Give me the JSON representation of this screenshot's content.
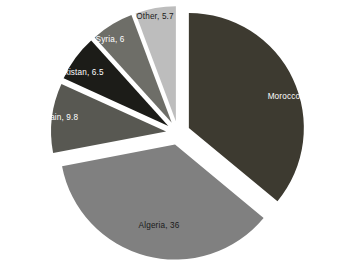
{
  "chart_data": {
    "type": "pie",
    "title": "",
    "subtitle": "",
    "xlabel": "",
    "ylabel": "",
    "legend": "none",
    "grid": false,
    "exploded": true,
    "label_format": "category, value",
    "categories": [
      "Morocco",
      "Algeria",
      "Spain",
      "Pakistan",
      "Syria",
      "Other"
    ],
    "values": [
      36,
      36,
      9.8,
      6.5,
      6,
      5.7
    ],
    "total": 100,
    "slices": [
      {
        "label": "Morocco, 36",
        "name": "Morocco",
        "value": 36,
        "color": "#3d3a30",
        "text_color": "#ffffff",
        "start_angle": 0,
        "end_angle": 129.6,
        "explode_px": 12,
        "label_x": 291,
        "label_y": 97
      },
      {
        "label": "Algeria, 36",
        "name": "Algeria",
        "value": 36,
        "color": "#808080",
        "text_color": "#1a1a1a",
        "start_angle": 129.6,
        "end_angle": 259.2,
        "explode_px": 12,
        "label_x": 159,
        "label_y": 226
      },
      {
        "label": "Spain, 9.8",
        "name": "Spain",
        "value": 9.8,
        "color": "#585852",
        "text_color": "#ffffff",
        "start_angle": 259.2,
        "end_angle": 294.48,
        "explode_px": 12,
        "label_x": 59,
        "label_y": 118
      },
      {
        "label": "Pakistan, 6.5",
        "name": "Pakistan",
        "value": 6.5,
        "color": "#1c1c18",
        "text_color": "#ffffff",
        "start_angle": 294.48,
        "end_angle": 317.88,
        "explode_px": 12,
        "label_x": 79,
        "label_y": 73
      },
      {
        "label": "Syria, 6",
        "name": "Syria",
        "value": 6,
        "color": "#6e6e68",
        "text_color": "#ffffff",
        "start_angle": 317.88,
        "end_angle": 339.48,
        "explode_px": 12,
        "label_x": 110,
        "label_y": 40
      },
      {
        "label": "Other, 5.7",
        "name": "Other",
        "value": 5.7,
        "color": "#bdbdbd",
        "text_color": "#1a1a1a",
        "start_angle": 339.48,
        "end_angle": 360,
        "explode_px": 12,
        "label_x": 155,
        "label_y": 17
      }
    ],
    "geometry": {
      "center_x": 178,
      "center_y": 133,
      "radius": 115,
      "background": "#ffffff"
    }
  }
}
